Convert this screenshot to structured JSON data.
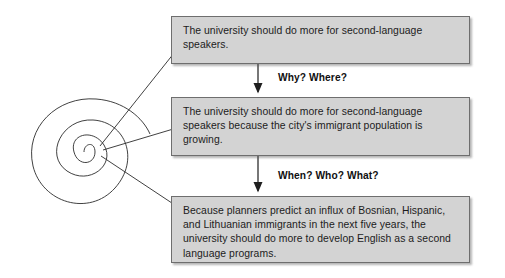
{
  "diagram": {
    "type": "thesis-refinement-flow",
    "source_node": {
      "icon": "spiral-icon",
      "label": "",
      "rings": 5
    },
    "steps": [
      {
        "id": "box-1",
        "text": "The university should do more for second-language speakers."
      },
      {
        "id": "box-2",
        "text": "The university should do more for second-language speakers because the city's immigrant population is growing."
      },
      {
        "id": "box-3",
        "text": "Because planners predict an influx of Bosnian, Hispanic, and Lithuanian immigrants in the next five years, the university should do more to develop English as a second language programs."
      }
    ],
    "connector_labels": [
      {
        "id": "label-1",
        "text": "Why? Where?"
      },
      {
        "id": "label-2",
        "text": "When? Who? What?"
      }
    ],
    "colors": {
      "box_fill": "#d3d3d3",
      "box_border": "#6e6e6e",
      "text": "#1c1c1c",
      "line": "#2b2b2b",
      "background": "#ffffff"
    }
  }
}
